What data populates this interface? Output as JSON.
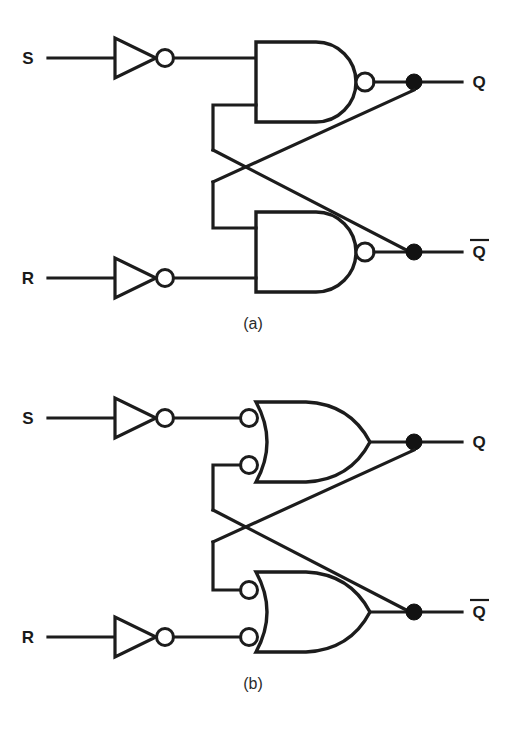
{
  "figure": {
    "ink_color": "#1c1c1c",
    "background_color": "#ffffff"
  },
  "panels": [
    {
      "id": "panel-a",
      "caption": "(a)",
      "gate_style": "NAND (AND shape with output bubble)",
      "inputs": [
        {
          "name": "S",
          "label": "S",
          "inverted_by": "inverter"
        },
        {
          "name": "R",
          "label": "R",
          "inverted_by": "inverter"
        }
      ],
      "outputs": [
        {
          "name": "Q",
          "label": "Q",
          "overbar": false
        },
        {
          "name": "Qbar",
          "label": "Q",
          "overbar": true
        }
      ],
      "gates": [
        {
          "id": "nand-top",
          "type": "nand",
          "input_count": 2,
          "output": "Q"
        },
        {
          "id": "nand-bottom",
          "type": "nand",
          "input_count": 2,
          "output": "Qbar"
        }
      ],
      "inverters": [
        {
          "id": "inverter-s",
          "type": "inverter",
          "input": "S"
        },
        {
          "id": "inverter-r",
          "type": "inverter",
          "input": "R"
        }
      ],
      "junction_dots": 2,
      "cross_coupled": true
    },
    {
      "id": "panel-b",
      "caption": "(b)",
      "gate_style": "OR shape with bubbles on both inputs (DeMorgan equivalent of NAND)",
      "inputs": [
        {
          "name": "S",
          "label": "S",
          "inverted_by": "inverter"
        },
        {
          "name": "R",
          "label": "R",
          "inverted_by": "inverter"
        }
      ],
      "outputs": [
        {
          "name": "Q",
          "label": "Q",
          "overbar": false
        },
        {
          "name": "Qbar",
          "label": "Q",
          "overbar": true
        }
      ],
      "gates": [
        {
          "id": "or-top",
          "type": "or-with-input-bubbles",
          "input_count": 2,
          "output": "Q"
        },
        {
          "id": "or-bottom",
          "type": "or-with-input-bubbles",
          "input_count": 2,
          "output": "Qbar"
        }
      ],
      "inverters": [
        {
          "id": "inverter-s",
          "type": "inverter",
          "input": "S"
        },
        {
          "id": "inverter-r",
          "type": "inverter",
          "input": "R"
        }
      ],
      "junction_dots": 2,
      "cross_coupled": true
    }
  ],
  "labels": {
    "panel_a": {
      "s": "S",
      "r": "R",
      "q": "Q",
      "qbar": "Q",
      "caption": "(a)"
    },
    "panel_b": {
      "s": "S",
      "r": "R",
      "q": "Q",
      "qbar": "Q",
      "caption": "(b)"
    }
  }
}
